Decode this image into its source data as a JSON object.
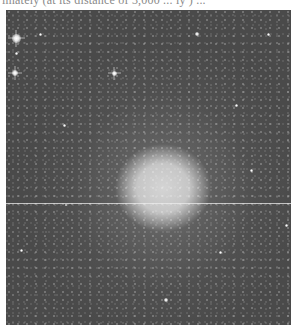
{
  "document": {
    "caption_fragment": "imately (at its distance of 3,000 ... ly ) ...",
    "figure": {
      "subject": "astronomical photograph of a bright diffuse stellar object (elliptical galaxy / star cluster) against a dense star field",
      "colors": {
        "background": "#050505",
        "core": "#d4d4d4",
        "halo": "#6e6e6e",
        "page": "#ffffff"
      }
    },
    "stars": [
      {
        "x": 10,
        "y": 28,
        "size": 9,
        "bright": true
      },
      {
        "x": 10,
        "y": 43,
        "size": 3,
        "bright": false
      },
      {
        "x": 34,
        "y": 24,
        "size": 3,
        "bright": false
      },
      {
        "x": 9,
        "y": 63,
        "size": 6,
        "bright": true
      },
      {
        "x": 108,
        "y": 63,
        "size": 5,
        "bright": true
      },
      {
        "x": 191,
        "y": 24,
        "size": 4,
        "bright": false
      },
      {
        "x": 262,
        "y": 24,
        "size": 3,
        "bright": false
      },
      {
        "x": 230,
        "y": 95,
        "size": 3,
        "bright": false
      },
      {
        "x": 58,
        "y": 115,
        "size": 3,
        "bright": false
      },
      {
        "x": 280,
        "y": 215,
        "size": 3,
        "bright": false
      },
      {
        "x": 15,
        "y": 240,
        "size": 3,
        "bright": false
      },
      {
        "x": 160,
        "y": 290,
        "size": 4,
        "bright": false
      },
      {
        "x": 214,
        "y": 242,
        "size": 3,
        "bright": false
      },
      {
        "x": 245,
        "y": 160,
        "size": 3,
        "bright": false
      },
      {
        "x": 60,
        "y": 195,
        "size": 2,
        "bright": false
      }
    ]
  }
}
